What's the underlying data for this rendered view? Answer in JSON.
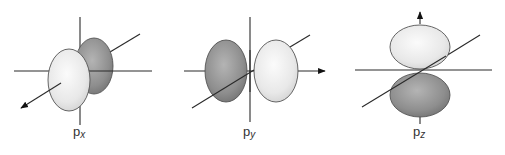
{
  "diagram": {
    "colors": {
      "light_lobe": "#ececec",
      "dark_lobe": "#8e8e8e",
      "axis": "#2a2a2a"
    },
    "orbitals": [
      {
        "id": "px",
        "base": "p",
        "subscript": "x",
        "arrow_axis": "diagonal"
      },
      {
        "id": "py",
        "base": "p",
        "subscript": "y",
        "arrow_axis": "horizontal"
      },
      {
        "id": "pz",
        "base": "p",
        "subscript": "z",
        "arrow_axis": "vertical"
      }
    ]
  }
}
